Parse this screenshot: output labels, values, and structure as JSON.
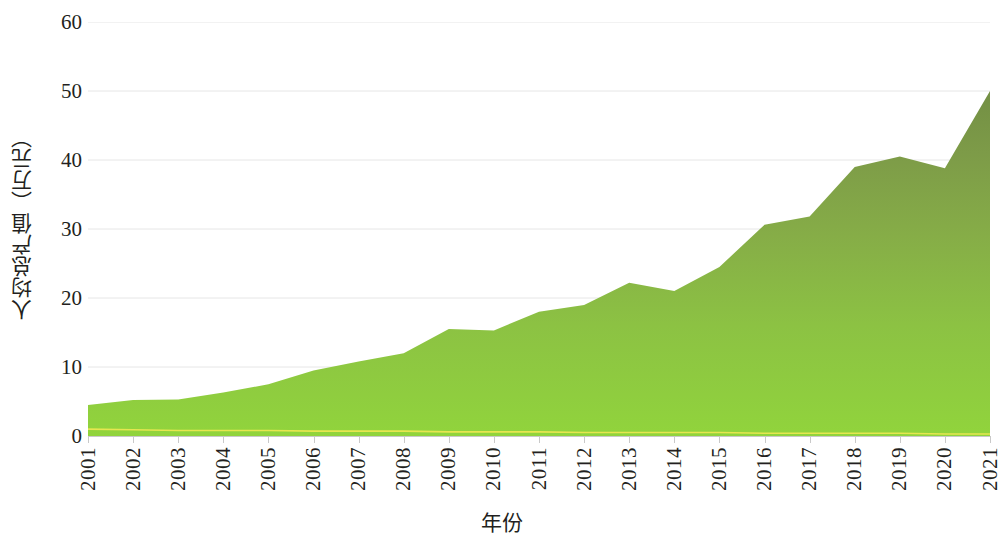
{
  "chart_data": {
    "type": "area",
    "title": "",
    "xlabel": "年份",
    "ylabel": "人均总产值（万元）",
    "categories": [
      "2001",
      "2002",
      "2003",
      "2004",
      "2005",
      "2006",
      "2007",
      "2008",
      "2009",
      "2010",
      "2011",
      "2012",
      "2013",
      "2014",
      "2015",
      "2016",
      "2017",
      "2018",
      "2019",
      "2020",
      "2021"
    ],
    "series": [
      {
        "name": "人均总产值",
        "values": [
          4.5,
          5.2,
          5.3,
          6.3,
          7.5,
          9.5,
          10.8,
          12.0,
          15.5,
          15.3,
          18.0,
          19.0,
          22.2,
          21.0,
          24.5,
          30.6,
          31.8,
          39.0,
          40.5,
          38.8,
          50.0
        ]
      },
      {
        "name": "基线",
        "values": [
          1.0,
          0.9,
          0.8,
          0.8,
          0.8,
          0.7,
          0.7,
          0.7,
          0.6,
          0.6,
          0.6,
          0.5,
          0.5,
          0.5,
          0.5,
          0.4,
          0.4,
          0.4,
          0.4,
          0.3,
          0.3
        ]
      }
    ],
    "ylim": [
      0,
      60
    ],
    "yticks": [
      0,
      10,
      20,
      30,
      40,
      50,
      60
    ],
    "ytick_labels": [
      "0",
      "10",
      "20",
      "30",
      "40",
      "50",
      "60"
    ],
    "grid": true,
    "grid_axis": "y",
    "legend": "none",
    "colors": {
      "area_top": "#7a9b49",
      "area_bottom": "#8ed13e",
      "baseline_line": "#e8e84a",
      "gridline": "#e6e6e6",
      "axis": "#c9c9c9",
      "text": "#231f20"
    }
  }
}
